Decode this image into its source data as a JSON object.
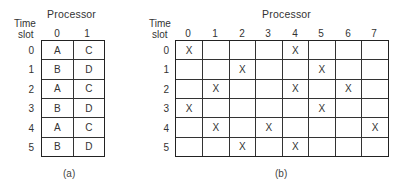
{
  "panel_a": {
    "title": "Processor",
    "row_header_line1": "Time",
    "row_header_line2": "slot",
    "columns": [
      "0",
      "1"
    ],
    "rows": [
      "0",
      "1",
      "2",
      "3",
      "4",
      "5"
    ],
    "cells": [
      [
        "A",
        "C"
      ],
      [
        "B",
        "D"
      ],
      [
        "A",
        "C"
      ],
      [
        "B",
        "D"
      ],
      [
        "A",
        "C"
      ],
      [
        "B",
        "D"
      ]
    ],
    "caption": "(a)"
  },
  "panel_b": {
    "title": "Processor",
    "row_header_line1": "Time",
    "row_header_line2": "slot",
    "columns": [
      "0",
      "1",
      "2",
      "3",
      "4",
      "5",
      "6",
      "7"
    ],
    "rows": [
      "0",
      "1",
      "2",
      "3",
      "4",
      "5"
    ],
    "mark": "X",
    "cells": [
      [
        "X",
        "",
        "",
        "",
        "X",
        "",
        "",
        ""
      ],
      [
        "",
        "",
        "X",
        "",
        "",
        "X",
        "",
        ""
      ],
      [
        "",
        "X",
        "",
        "",
        "X",
        "",
        "X",
        ""
      ],
      [
        "X",
        "",
        "",
        "",
        "",
        "X",
        "",
        ""
      ],
      [
        "",
        "X",
        "",
        "X",
        "",
        "",
        "",
        "X"
      ],
      [
        "",
        "",
        "X",
        "",
        "X",
        "",
        "",
        ""
      ]
    ],
    "caption": "(b)"
  }
}
